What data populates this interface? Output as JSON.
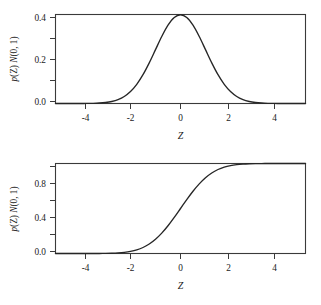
{
  "figure": {
    "background": "#ffffff",
    "line_color": "#262626",
    "axis_color": "#3a3a3a",
    "panel_count": 2
  },
  "chart_data": [
    {
      "type": "line",
      "id": "standard-normal-pdf",
      "title": "",
      "xlabel": "Z",
      "ylabel": "p(Z) N(0, 1)",
      "ylabel_parts": {
        "p": "p",
        "paren_z": "(Z)",
        "space": " ",
        "n": "N",
        "args": "(0, 1)"
      },
      "xlim": [
        -5,
        5
      ],
      "ylim": [
        0.0,
        0.4
      ],
      "xticks": [
        -4,
        -2,
        0,
        2,
        4
      ],
      "xticklabels": [
        "-4",
        "-2",
        "0",
        "2",
        "4"
      ],
      "yticks": [
        0.0,
        0.2,
        0.4
      ],
      "yticklabels": [
        "0.0",
        "0.2",
        "0.4"
      ],
      "yminorticks": [
        0.1,
        0.3
      ],
      "grid": false,
      "legend": "none",
      "series": [
        {
          "name": "N(0, 1) density",
          "x": [
            -5.0,
            -4.75,
            -4.5,
            -4.25,
            -4.0,
            -3.75,
            -3.5,
            -3.25,
            -3.0,
            -2.75,
            -2.5,
            -2.25,
            -2.0,
            -1.75,
            -1.5,
            -1.25,
            -1.0,
            -0.75,
            -0.5,
            -0.25,
            0.0,
            0.25,
            0.5,
            0.75,
            1.0,
            1.25,
            1.5,
            1.75,
            2.0,
            2.25,
            2.5,
            2.75,
            3.0,
            3.25,
            3.5,
            3.75,
            4.0,
            4.25,
            4.5,
            4.75,
            5.0
          ],
          "y": [
            1.5e-06,
            6.3e-06,
            1.6e-05,
            4.22e-05,
            0.0001338,
            0.0003467,
            0.0008727,
            0.002075,
            0.0044318,
            0.0090937,
            0.0175283,
            0.031658,
            0.053991,
            0.0862773,
            0.1295176,
            0.1826491,
            0.2419707,
            0.3011374,
            0.3520653,
            0.3866681,
            0.3989423,
            0.3866681,
            0.3520653,
            0.3011374,
            0.2419707,
            0.1826491,
            0.1295176,
            0.0862773,
            0.053991,
            0.031658,
            0.0175283,
            0.0090937,
            0.0044318,
            0.002075,
            0.0008727,
            0.0003467,
            0.0001338,
            4.22e-05,
            1.6e-05,
            6.3e-06,
            1.5e-06
          ]
        }
      ]
    },
    {
      "type": "line",
      "id": "standard-normal-cdf",
      "title": "",
      "xlabel": "Z",
      "ylabel": "p(Z) N(0, 1)",
      "ylabel_parts": {
        "p": "p",
        "paren_z": "(Z)",
        "space": " ",
        "n": "N",
        "args": "(0, 1)"
      },
      "xlim": [
        -5,
        5
      ],
      "ylim": [
        0.0,
        1.0
      ],
      "xticks": [
        -4,
        -2,
        0,
        2,
        4
      ],
      "xticklabels": [
        "-4",
        "-2",
        "0",
        "2",
        "4"
      ],
      "yticks": [
        0.0,
        0.4,
        0.8
      ],
      "yticklabels": [
        "0.0",
        "0.4",
        "0.8"
      ],
      "yminorticks": [
        0.2,
        0.6,
        1.0
      ],
      "grid": false,
      "legend": "none",
      "series": [
        {
          "name": "N(0, 1) cumulative distribution",
          "x": [
            -5.0,
            -4.75,
            -4.5,
            -4.25,
            -4.0,
            -3.75,
            -3.5,
            -3.25,
            -3.0,
            -2.75,
            -2.5,
            -2.25,
            -2.0,
            -1.75,
            -1.5,
            -1.25,
            -1.0,
            -0.75,
            -0.5,
            -0.25,
            0.0,
            0.25,
            0.5,
            0.75,
            1.0,
            1.25,
            1.5,
            1.75,
            2.0,
            2.25,
            2.5,
            2.75,
            3.0,
            3.25,
            3.5,
            3.75,
            4.0,
            4.25,
            4.5,
            4.75,
            5.0
          ],
          "y": [
            3e-07,
            1e-06,
            3.4e-06,
            1.07e-05,
            3.17e-05,
            8.84e-05,
            0.0002326,
            0.000577,
            0.0013499,
            0.0029798,
            0.0062097,
            0.0122245,
            0.0227501,
            0.0400592,
            0.0668072,
            0.1056498,
            0.1586553,
            0.2266274,
            0.3085375,
            0.4012937,
            0.5,
            0.5987063,
            0.6914625,
            0.7733726,
            0.8413447,
            0.8943502,
            0.9331928,
            0.9599408,
            0.9772499,
            0.9877755,
            0.9937903,
            0.9970202,
            0.9986501,
            0.999423,
            0.9997674,
            0.9999116,
            0.9999683,
            0.9999893,
            0.9999966,
            0.999999,
            0.9999997
          ]
        }
      ]
    }
  ]
}
